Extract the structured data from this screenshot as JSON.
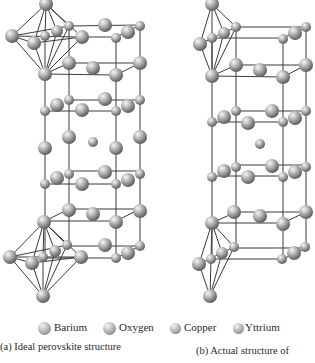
{
  "figure": {
    "legend": [
      {
        "label": "Barium",
        "icon": "barium-sphere-icon",
        "size": 12
      },
      {
        "label": "Oxygen",
        "icon": "oxygen-sphere-icon",
        "size": 12
      },
      {
        "label": "Copper",
        "icon": "copper-sphere-icon",
        "size": 10
      },
      {
        "label": "Yttrium",
        "icon": "yttrium-sphere-icon",
        "size": 10
      }
    ],
    "captions": {
      "a": "(a) Ideal perovskite structure",
      "b": "(b) Actual structure of"
    },
    "colors": {
      "atom_highlight": "#f4f4f4",
      "atom_mid": "#b8b8b8",
      "atom_shadow": "#6e6e6e",
      "bond": "#3a3a3a",
      "background": "#ffffff"
    }
  }
}
